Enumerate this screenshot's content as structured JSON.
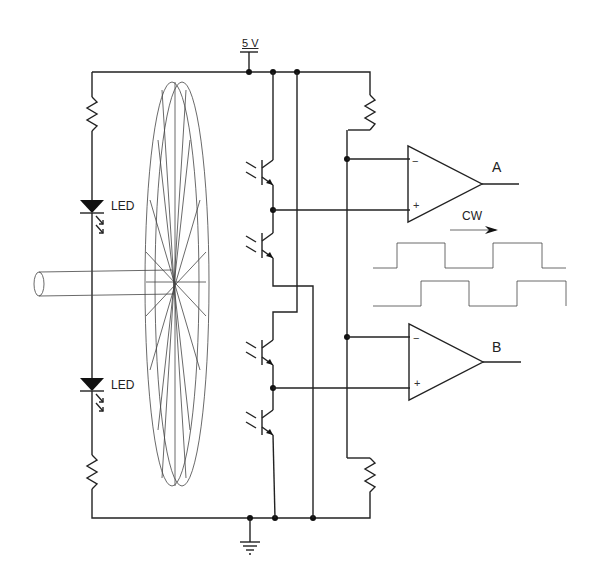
{
  "diagram": {
    "supply_label": "5 V",
    "led_top_label": "LED",
    "led_bottom_label": "LED",
    "output_a_label": "A",
    "output_b_label": "B",
    "direction_label": "CW",
    "comparator_a": {
      "minus": "−",
      "plus": "+"
    },
    "comparator_b": {
      "minus": "−",
      "plus": "+"
    },
    "waveforms": [
      {
        "name": "A",
        "edges_x": [
          397,
          447,
          493,
          543
        ]
      },
      {
        "name": "B",
        "edges_x": [
          421,
          470,
          517,
          566
        ]
      }
    ],
    "components": {
      "resistors": 4,
      "leds": 2,
      "phototransistors": 4,
      "comparators": 2,
      "encoder_disk": 1,
      "shaft": 1,
      "ground": 1
    }
  }
}
